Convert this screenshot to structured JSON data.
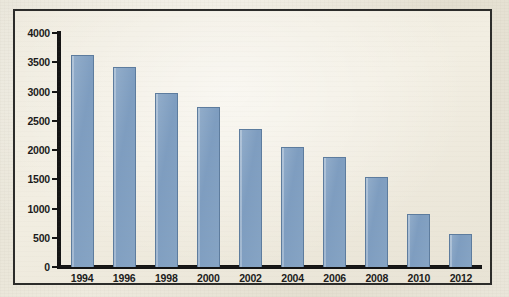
{
  "chart_data": {
    "type": "bar",
    "title": "",
    "subtitle": "",
    "xlabel": "",
    "ylabel": "",
    "categories": [
      "1994",
      "1996",
      "1998",
      "2000",
      "2002",
      "2004",
      "2006",
      "2008",
      "2010",
      "2012"
    ],
    "values": [
      3620,
      3420,
      2980,
      2730,
      2360,
      2050,
      1880,
      1540,
      900,
      560
    ],
    "series": [
      {
        "name": "",
        "values": [
          3620,
          3420,
          2980,
          2730,
          2360,
          2050,
          1880,
          1540,
          900,
          560
        ]
      }
    ],
    "ylim": [
      0,
      4000
    ],
    "y_ticks": [
      0,
      500,
      1000,
      1500,
      2000,
      2500,
      3000,
      3500,
      4000
    ],
    "y_tick_labels": [
      "0",
      "500",
      "1000",
      "1500",
      "2000",
      "2500",
      "3000",
      "3500",
      "4000"
    ],
    "x_tick_labels": [
      "1994",
      "1996",
      "1998",
      "2000",
      "2002",
      "2004",
      "2006",
      "2008",
      "2010",
      "2012"
    ],
    "grid": false,
    "legend": "none",
    "bar_color": "#86a4c4",
    "bar_border_color": "#5d7c9e",
    "axis_color": "#141414",
    "background_color": "#efebdf",
    "frame_color": "#2c2c2a"
  }
}
